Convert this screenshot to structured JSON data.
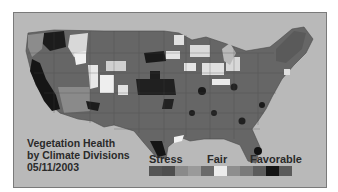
{
  "map": {
    "title_lines": [
      "Vegetation Health",
      "by Climate Divisions",
      "05/11/2003"
    ],
    "background_color": "#b9b9b9",
    "regions_shading": {
      "west_coast": "#1e1e1e",
      "northwest": "#6a6a6a",
      "idaho_highlight": "#e6e6e6",
      "great_plains_dark": "#1a1a1a",
      "midwest_light": "#e0e0e0",
      "south": "#666666",
      "east": "#5e5e5e"
    }
  },
  "legend": {
    "labels": {
      "stress": "Stress",
      "fair": "Fair",
      "favorable": "Favorable"
    },
    "swatches": [
      "#555555",
      "#4e4e4e",
      "#8a8a8a",
      "#9a9a9a",
      "#6a6a6a",
      "#ececec",
      "#8e8e8e",
      "#7a7a7a",
      "#5c5c5c",
      "#141414",
      "#5a5a5a"
    ]
  }
}
